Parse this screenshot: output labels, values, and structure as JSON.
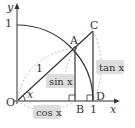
{
  "diagram": {
    "axes": {
      "x_label": "x",
      "y_label": "y",
      "x_tick": "1",
      "y_tick": "1"
    },
    "points": {
      "origin": "O",
      "A": "A",
      "B": "B",
      "C": "C",
      "D": "D"
    },
    "labels": {
      "radius": "1",
      "angle": "x",
      "sin": "sin x",
      "cos": "cos x",
      "tan": "tan x"
    },
    "colors": {
      "line": "#333333",
      "dashed": "#aaaaaa",
      "label_box": "#dddddd"
    }
  }
}
